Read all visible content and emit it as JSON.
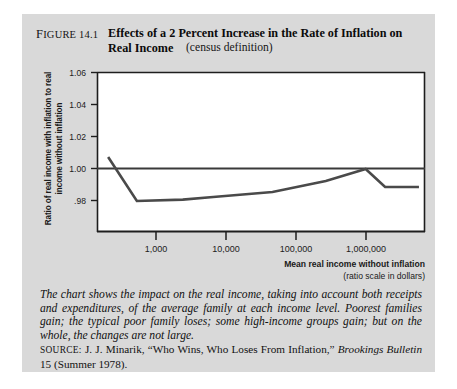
{
  "figure": {
    "number_prefix": "F",
    "number_rest": "IGURE",
    "number_value": "14.1",
    "title": "Effects of a 2 Percent Increase in the Rate of Inflation on Real Income",
    "subtitle": "(census definition)"
  },
  "caption": {
    "body": "The chart shows the impact on the real income, taking into account both receipts and expenditures, of the average family at each income level.  Poorest families gain; the typical poor family loses; some high-income groups gain; but on the whole, the changes are not large.",
    "source_label": "SOURCE:",
    "source_text_1": " J. J. Minarik, “Who Wins, Who Loses From Inflation,” ",
    "source_italic": "Brookings Bulletin",
    "source_text_2": " 15 (Summer 1978)."
  },
  "chart_data": {
    "type": "line",
    "title": "Effects of a 2 Percent Increase in the Rate of Inflation on Real Income",
    "xlabel": "Mean real income without inflation",
    "xlabel_sub": "(ratio scale in dollars)",
    "ylabel": "Ratio of real income with inflation to real income without inflation",
    "xscale": "log",
    "xlim": [
      300,
      6000000
    ],
    "ylim": [
      0.98,
      1.06
    ],
    "grid": false,
    "legend": "none",
    "reference_line_y": 1.0,
    "yticks": [
      "1.06",
      "1.04",
      "1.02",
      "1.00",
      ".98"
    ],
    "ytick_values": [
      1.06,
      1.04,
      1.02,
      1.0,
      0.98
    ],
    "xticks": [
      "1,000",
      "10,000",
      "100,000",
      "1,000,000"
    ],
    "xtick_values": [
      1000,
      10000,
      100000,
      1000000
    ],
    "series": [
      {
        "name": "Ratio of real income with inflation to without",
        "x": [
          420,
          1000,
          4000,
          10000,
          60000,
          300000,
          1000000,
          1800000,
          5000000
        ],
        "y": [
          1.0175,
          0.9955,
          0.9962,
          0.9975,
          1.0,
          1.0055,
          1.0115,
          1.0025,
          1.0025
        ]
      }
    ]
  }
}
